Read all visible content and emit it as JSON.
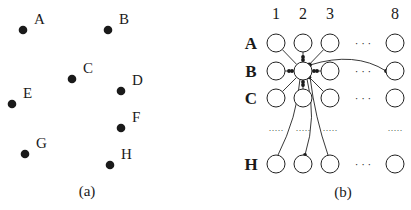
{
  "panel_a": {
    "caption": "(a)",
    "points": [
      {
        "label": "A"
      },
      {
        "label": "B"
      },
      {
        "label": "C"
      },
      {
        "label": "D"
      },
      {
        "label": "E"
      },
      {
        "label": "F"
      },
      {
        "label": "G"
      },
      {
        "label": "H"
      }
    ]
  },
  "panel_b": {
    "caption": "(b)",
    "column_labels": [
      "1",
      "2",
      "3",
      "8"
    ],
    "row_labels": [
      "A",
      "B",
      "C",
      "H"
    ],
    "horizontal_ellipsis": "· · ·",
    "vertical_ellipsis": "·····",
    "center_node": "B2",
    "connected_to": [
      "A1",
      "A2",
      "A3",
      "B1",
      "B3",
      "B8",
      "C1",
      "C2",
      "C3",
      "H1",
      "H2",
      "H3"
    ]
  }
}
